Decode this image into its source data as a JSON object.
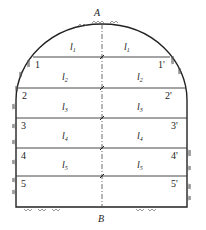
{
  "diagram": {
    "top_point": "A",
    "bottom_point": "B",
    "left_points": [
      "1",
      "2",
      "3",
      "4",
      "5"
    ],
    "right_points": [
      "1'",
      "2'",
      "3'",
      "4'",
      "5'"
    ],
    "layers": [
      {
        "symbol": "l",
        "sub": "1"
      },
      {
        "symbol": "l",
        "sub": "2"
      },
      {
        "symbol": "l",
        "sub": "3"
      },
      {
        "symbol": "l",
        "sub": "4"
      },
      {
        "symbol": "l",
        "sub": "5"
      }
    ],
    "colors": {
      "line": "#222222",
      "background": "#ffffff"
    }
  }
}
